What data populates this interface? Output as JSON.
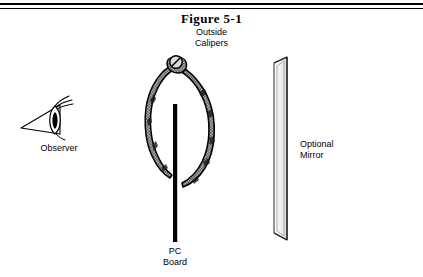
{
  "figure": {
    "title": "Figure 5-1",
    "labels": {
      "calipers": "Outside\nCalipers",
      "observer": "Observer",
      "pc_board": "PC\nBoard",
      "mirror": "Optional\nMirror"
    },
    "icons": {
      "eye": "eye-icon",
      "calipers": "outside-calipers-icon",
      "pc_board": "pc-board-icon",
      "mirror": "mirror-icon",
      "pivot_screw": "pivot-screw-icon"
    },
    "colors": {
      "ink": "#000000",
      "metal_fill": "#8c8c8c",
      "metal_light": "#c9c9c9",
      "mirror_edge": "#4a4a4a",
      "background": "#ffffff"
    }
  }
}
